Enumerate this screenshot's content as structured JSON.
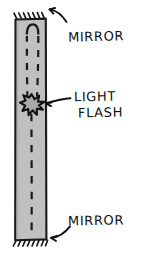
{
  "figure": {
    "title_visible": false,
    "style": "hand-drawn ink sketch",
    "background_color": "#ffffff",
    "ink_color": "#111111",
    "bar_fill_color": "#c0c0c0",
    "bar_stroke_color": "#1a1a1a"
  },
  "labels": {
    "mirror_top": "MIRROR",
    "mirror_bottom": "MIRROR",
    "light": "LIGHT",
    "flash": "FLASH"
  },
  "elements": {
    "bar_name": "light-clock-bar",
    "mirror_top_name": "top-mirror-surface",
    "mirror_bottom_name": "bottom-mirror-surface",
    "flash_name": "light-flash-starburst",
    "beam_path_name": "dashed-light-beam-path"
  }
}
